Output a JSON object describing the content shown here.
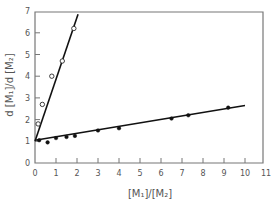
{
  "chart_data": {
    "type": "scatter",
    "title": "",
    "xlabel": "[M₁]/[M₂]",
    "ylabel": "d [M₁]/d [M₂]",
    "xlim": [
      0,
      11
    ],
    "ylim": [
      0,
      7
    ],
    "x_ticks": [
      0,
      1,
      2,
      3,
      4,
      5,
      6,
      7,
      8,
      9,
      10,
      11
    ],
    "y_ticks": [
      0,
      1,
      2,
      3,
      4,
      5,
      6,
      7
    ],
    "grid": false,
    "legend": null,
    "series": [
      {
        "name": "open-circles",
        "marker": "open-circle",
        "x": [
          0.15,
          0.35,
          0.8,
          1.3,
          1.85
        ],
        "y": [
          1.8,
          2.7,
          4.0,
          4.7,
          6.2
        ],
        "fit_line": {
          "x": [
            0,
            2.05
          ],
          "y": [
            1.0,
            6.85
          ]
        }
      },
      {
        "name": "filled-circles",
        "marker": "filled-circle",
        "x": [
          0.2,
          0.6,
          1.0,
          1.5,
          1.9,
          3.0,
          4.0,
          6.5,
          7.3,
          9.2
        ],
        "y": [
          1.05,
          0.95,
          1.15,
          1.2,
          1.25,
          1.5,
          1.6,
          2.05,
          2.2,
          2.55
        ],
        "fit_line": {
          "x": [
            0,
            10
          ],
          "y": [
            1.05,
            2.65
          ]
        }
      }
    ]
  },
  "axes": {
    "x_label_text": "[M₁]/[M₂]",
    "y_label_text": "d [M₁]/d [M₂]"
  },
  "colors": {
    "axis": "#777777",
    "line": "#111111",
    "text": "#555555"
  }
}
